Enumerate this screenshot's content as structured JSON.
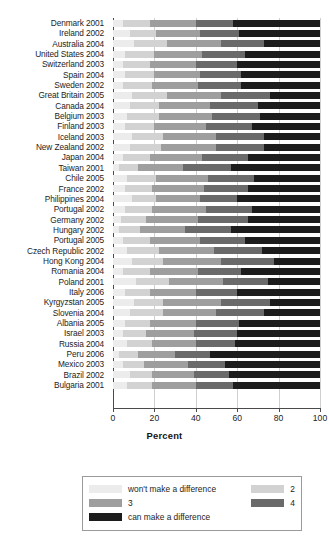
{
  "chart_data": {
    "type": "bar",
    "orientation": "horizontal",
    "stacked": true,
    "stack_mode": "percent",
    "title": "",
    "xlabel": "Percent",
    "ylabel": "",
    "xlim": [
      0,
      100
    ],
    "xticks": [
      0,
      20,
      40,
      60,
      80,
      100
    ],
    "grid": true,
    "legend_position": "bottom",
    "legend": [
      "won't make a difference",
      "2",
      "3",
      "4",
      "can make a difference"
    ],
    "colors": [
      "#ececec",
      "#d2d2d2",
      "#9e9e9e",
      "#6a6a6a",
      "#1c1c1c"
    ],
    "categories": [
      "Denmark 2001",
      "Ireland 2002",
      "Australia 2004",
      "United States 2004",
      "Switzerland 2003",
      "Spain 2004",
      "Sweden 2002",
      "Great Britain 2005",
      "Canada 2004",
      "Belgium 2003",
      "Finland 2003",
      "Iceland 2003",
      "New Zealand 2002",
      "Japan 2004",
      "Taiwan 2001",
      "Chile 2005",
      "France 2002",
      "Philippines 2004",
      "Portugal 2002",
      "Germany 2002",
      "Hungary 2002",
      "Portugal 2005",
      "Czech Republic 2002",
      "Hong Kong 2004",
      "Romania 2004",
      "Poland 2001",
      "Italy 2006",
      "Kyrgyzstan 2005",
      "Slovenia 2004",
      "Albania 2005",
      "Israel 2003",
      "Russia 2004",
      "Peru 2006",
      "Mexico 2003",
      "Brazil 2002",
      "Bulgaria 2001"
    ],
    "series": [
      {
        "name": "won't make a difference",
        "values": [
          5,
          8,
          10,
          6,
          5,
          6,
          5,
          9,
          8,
          7,
          6,
          9,
          8,
          5,
          3,
          7,
          6,
          9,
          6,
          4,
          3,
          5,
          7,
          9,
          5,
          11,
          6,
          10,
          8,
          6,
          5,
          7,
          3,
          5,
          8,
          7
        ]
      },
      {
        "name": "2",
        "values": [
          13,
          13,
          16,
          14,
          13,
          14,
          14,
          17,
          14,
          15,
          14,
          15,
          15,
          13,
          9,
          14,
          13,
          12,
          13,
          12,
          10,
          13,
          15,
          15,
          13,
          16,
          12,
          14,
          16,
          12,
          11,
          12,
          9,
          10,
          11,
          12
        ]
      },
      {
        "name": "3",
        "values": [
          22,
          21,
          26,
          23,
          22,
          22,
          22,
          26,
          25,
          26,
          25,
          26,
          27,
          25,
          22,
          25,
          25,
          21,
          26,
          25,
          22,
          24,
          27,
          28,
          23,
          26,
          22,
          28,
          26,
          22,
          23,
          21,
          18,
          21,
          20,
          21
        ]
      },
      {
        "name": "4",
        "values": [
          18,
          19,
          21,
          21,
          20,
          20,
          21,
          24,
          23,
          23,
          22,
          23,
          23,
          22,
          23,
          22,
          21,
          18,
          22,
          24,
          22,
          22,
          23,
          26,
          21,
          22,
          20,
          24,
          23,
          21,
          21,
          19,
          17,
          18,
          17,
          18
        ]
      },
      {
        "name": "can make a difference",
        "values": [
          42,
          39,
          27,
          36,
          40,
          38,
          38,
          24,
          30,
          29,
          33,
          27,
          27,
          35,
          43,
          32,
          35,
          40,
          33,
          35,
          43,
          36,
          28,
          22,
          38,
          25,
          40,
          24,
          27,
          39,
          40,
          41,
          53,
          46,
          44,
          42
        ]
      }
    ]
  },
  "axis": {
    "x_title": "Percent",
    "tick_labels": [
      "0",
      "20",
      "40",
      "60",
      "80",
      "100"
    ]
  },
  "legend_box": {
    "items": [
      {
        "label": "won't make a difference",
        "swatch": "#ececec"
      },
      {
        "label": "2",
        "swatch": "#d2d2d2"
      },
      {
        "label": "3",
        "swatch": "#9e9e9e"
      },
      {
        "label": "4",
        "swatch": "#6a6a6a"
      },
      {
        "label": "can make a difference",
        "swatch": "#1c1c1c"
      }
    ]
  }
}
